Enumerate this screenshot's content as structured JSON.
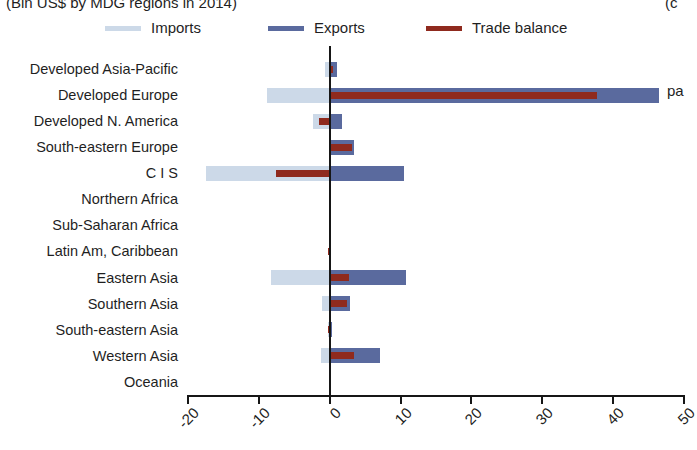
{
  "title": {
    "text": "(Bln US$ by MDG regions in 2014)",
    "right_fragment": "(c"
  },
  "annotation": {
    "right_text": "pa"
  },
  "legend": {
    "items": [
      {
        "label": "Imports",
        "color": "#ccd9e8",
        "name": "imports"
      },
      {
        "label": "Exports",
        "color": "#5a6a9e",
        "name": "exports"
      },
      {
        "label": "Trade balance",
        "color": "#8f2a1e",
        "name": "trade-balance"
      }
    ]
  },
  "colors": {
    "imports": "#ccd9e8",
    "exports": "#5a6a9e",
    "balance": "#8f2a1e",
    "axis": "#161616",
    "background": "#ffffff"
  },
  "axis": {
    "x_ticks": [
      "-20",
      "-10",
      "0",
      "10",
      "20",
      "30",
      "40",
      "50"
    ],
    "x_tick_values": [
      -20,
      -10,
      0,
      10,
      20,
      30,
      40,
      50
    ],
    "xlim": [
      -20,
      50
    ],
    "ylabel": "",
    "xlabel": ""
  },
  "chart_data": {
    "type": "bar",
    "orientation": "horizontal",
    "title": "(Bln US$ by MDG regions in 2014)",
    "xlabel": "",
    "ylabel": "",
    "xlim": [
      -20,
      50
    ],
    "grid": false,
    "legend_position": "top",
    "categories": [
      "Developed Asia-Pacific",
      "Developed Europe",
      "Developed N. America",
      "South-eastern Europe",
      "C I S",
      "Northern Africa",
      "Sub-Saharan Africa",
      "Latin Am, Caribbean",
      "Eastern Asia",
      "Southern Asia",
      "South-eastern Asia",
      "Western Asia",
      "Oceania"
    ],
    "series": [
      {
        "name": "Imports",
        "color": "#ccd9e8",
        "values": [
          -0.6,
          -8.8,
          -2.4,
          -0.1,
          -17.5,
          0.0,
          0.0,
          -0.1,
          -8.3,
          -1.1,
          -0.2,
          -1.3,
          0.0
        ]
      },
      {
        "name": "Exports",
        "color": "#5a6a9e",
        "values": [
          1.0,
          46.5,
          1.8,
          3.4,
          10.5,
          0.0,
          0.0,
          0.1,
          10.7,
          2.9,
          0.3,
          7.1,
          0.0
        ]
      },
      {
        "name": "Trade balance",
        "color": "#8f2a1e",
        "values": [
          0.4,
          37.7,
          -1.5,
          3.1,
          -7.6,
          0.0,
          0.0,
          -0.2,
          2.7,
          2.4,
          -0.3,
          3.4,
          0.0
        ]
      }
    ]
  }
}
